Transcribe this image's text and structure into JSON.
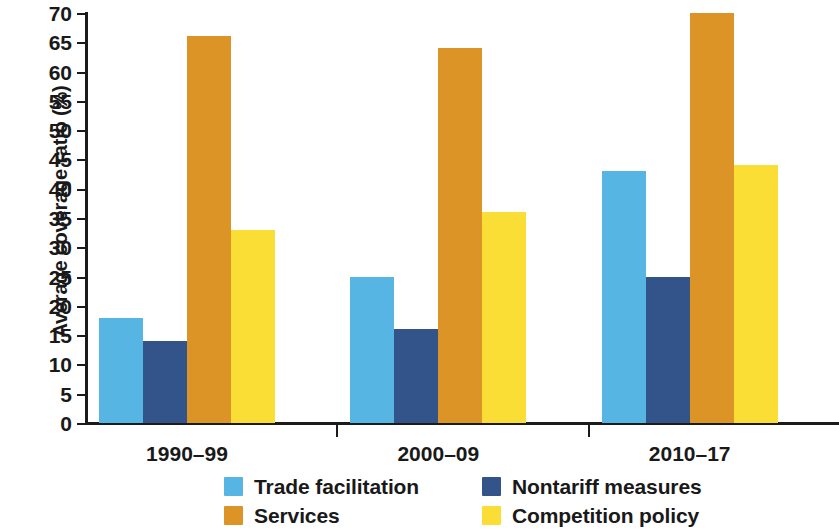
{
  "chart_data": {
    "type": "bar",
    "title": "",
    "xlabel": "",
    "ylabel": "Average coverage ratio (%)",
    "categories": [
      "1990–99",
      "2000–09",
      "2010–17"
    ],
    "series": [
      {
        "name": "Trade facilitation",
        "color": "#57b5e3",
        "values": [
          18,
          25,
          43
        ]
      },
      {
        "name": "Nontariff measures",
        "color": "#33548a",
        "values": [
          14,
          16,
          25
        ]
      },
      {
        "name": "Services",
        "color": "#dd9426",
        "values": [
          66,
          64,
          70
        ]
      },
      {
        "name": "Competition policy",
        "color": "#fade36",
        "values": [
          33,
          36,
          44
        ]
      }
    ],
    "ylim": [
      0,
      70
    ],
    "ytick_step": 5,
    "ytick_labels": [
      "70",
      "65",
      "60",
      "55",
      "50",
      "45",
      "40",
      "35",
      "30",
      "25",
      "20",
      "15",
      "10",
      "5",
      "0"
    ],
    "grid": false,
    "legend_position": "bottom",
    "legend_columns": 2,
    "legend_order": [
      "Trade facilitation",
      "Nontariff measures",
      "Services",
      "Competition policy"
    ],
    "axis_color": "#1b1b1c",
    "background_color": "#ffffff"
  }
}
